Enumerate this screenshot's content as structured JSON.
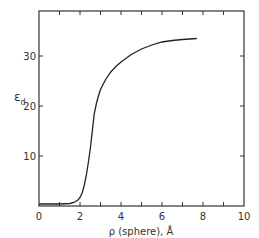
{
  "chart_data": {
    "type": "line",
    "title": "",
    "xlabel": "ρ (sphere), Å",
    "ylabel": "ε_d",
    "ylabel_main": "ε",
    "ylabel_sub": "d",
    "xlim": [
      0,
      10
    ],
    "ylim": [
      0,
      39
    ],
    "x_ticks": [
      0,
      2,
      4,
      6,
      8,
      10
    ],
    "x_minor_ticks": [
      1,
      3,
      5,
      7,
      9
    ],
    "y_ticks": [
      10,
      20,
      30
    ],
    "y_zero_label": "0",
    "grid": false,
    "legend": null,
    "series": [
      {
        "name": "epsilon_d",
        "x": [
          0.0,
          0.5,
          1.0,
          1.5,
          1.7,
          1.9,
          2.0,
          2.1,
          2.2,
          2.3,
          2.4,
          2.5,
          2.6,
          2.7,
          2.8,
          2.9,
          3.0,
          3.25,
          3.5,
          3.75,
          4.0,
          4.5,
          5.0,
          5.5,
          6.0,
          6.5,
          7.0,
          7.7
        ],
        "y": [
          0.4,
          0.4,
          0.4,
          0.5,
          0.7,
          1.2,
          1.7,
          2.6,
          4.0,
          6.0,
          8.5,
          11.5,
          15.0,
          18.5,
          20.5,
          22.0,
          23.3,
          25.3,
          26.8,
          27.9,
          28.8,
          30.3,
          31.4,
          32.2,
          32.8,
          33.1,
          33.3,
          33.5
        ]
      }
    ]
  },
  "colors": {
    "line": "#222222",
    "axis": "#333333",
    "background": "#ffffff"
  }
}
